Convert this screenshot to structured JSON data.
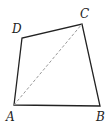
{
  "diagram": {
    "type": "quadrilateral",
    "points": {
      "A": {
        "x": 14,
        "y": 105,
        "label": "A",
        "lx": 6,
        "ly": 121
      },
      "B": {
        "x": 100,
        "y": 106,
        "label": "B",
        "lx": 96,
        "ly": 121
      },
      "C": {
        "x": 82,
        "y": 24,
        "label": "C",
        "lx": 80,
        "ly": 18
      },
      "D": {
        "x": 22,
        "y": 38,
        "label": "D",
        "lx": 12,
        "ly": 33
      }
    },
    "edges": [
      [
        "A",
        "B"
      ],
      [
        "B",
        "C"
      ],
      [
        "C",
        "D"
      ],
      [
        "D",
        "A"
      ]
    ],
    "dashed": [
      [
        "A",
        "C"
      ]
    ],
    "colors": {
      "stroke": "#222222",
      "dashed": "#999999"
    }
  }
}
